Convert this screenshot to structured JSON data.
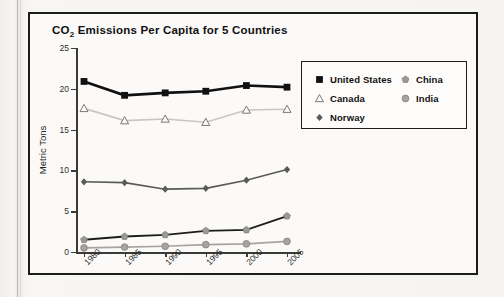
{
  "figure": {
    "title_main": "CO",
    "title_sub": "2",
    "title_rest": " Emissions Per Capita for 5 Countries"
  },
  "chart_data": {
    "type": "line",
    "title": "CO2 Emissions Per Capita for 5 Countries",
    "xlabel": "",
    "ylabel": "Metric Tons",
    "categories": [
      "1980",
      "1985",
      "1990",
      "1995",
      "2000",
      "2005"
    ],
    "x": [
      1980,
      1985,
      1990,
      1995,
      2000,
      2005
    ],
    "ylim": [
      0,
      25
    ],
    "yticks": [
      0,
      5,
      10,
      15,
      20,
      25
    ],
    "grid": false,
    "legend_position": "upper right (inset box)",
    "series": [
      {
        "name": "United States",
        "marker": "filled-square",
        "color": "#111111",
        "line_color": "#111111",
        "values": [
          20.9,
          19.2,
          19.5,
          19.7,
          20.4,
          20.2
        ]
      },
      {
        "name": "Canada",
        "marker": "open-triangle",
        "color": "#c9c6c0",
        "line_color": "#c9c6c0",
        "values": [
          17.6,
          16.1,
          16.3,
          15.9,
          17.4,
          17.5
        ]
      },
      {
        "name": "Norway",
        "marker": "filled-diamond",
        "color": "#5a5a58",
        "line_color": "#5a5a58",
        "values": [
          8.6,
          8.5,
          7.7,
          7.8,
          8.8,
          10.1
        ]
      },
      {
        "name": "China",
        "marker": "gray-pentagon",
        "color": "#9a9996",
        "line_color": "#1d1d1b",
        "values": [
          1.5,
          1.9,
          2.1,
          2.6,
          2.7,
          4.4
        ]
      },
      {
        "name": "India",
        "marker": "gray-circle",
        "color": "#a5a4a1",
        "line_color": "#a5a4a1",
        "values": [
          0.5,
          0.6,
          0.7,
          0.9,
          1.0,
          1.3
        ]
      }
    ]
  },
  "legend": {
    "left_items": [
      {
        "label": "United States",
        "marker": "filled-square"
      },
      {
        "label": "Canada",
        "marker": "open-triangle"
      },
      {
        "label": "Norway",
        "marker": "filled-diamond"
      }
    ],
    "right_items": [
      {
        "label": "China",
        "marker": "gray-pentagon"
      },
      {
        "label": "India",
        "marker": "gray-circle"
      }
    ]
  }
}
